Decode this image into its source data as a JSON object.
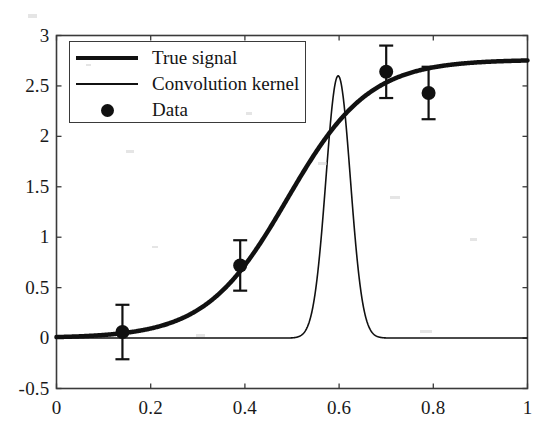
{
  "figure": {
    "background_color": "#ffffff",
    "axis_color": "#3a3a3a",
    "curve_color": "#111111"
  },
  "axes": {
    "x_ticks": [
      "0",
      "0.2",
      "0.4",
      "0.6",
      "0.8",
      "1"
    ],
    "x_tick_values": [
      0,
      0.2,
      0.4,
      0.6,
      0.8,
      1
    ],
    "y_ticks": [
      "-0.5",
      "0",
      "0.5",
      "1",
      "1.5",
      "2",
      "2.5",
      "3"
    ],
    "y_tick_values": [
      -0.5,
      0,
      0.5,
      1,
      1.5,
      2,
      2.5,
      3
    ]
  },
  "legend": {
    "entries": [
      {
        "label": "True signal",
        "marker": "thick-line"
      },
      {
        "label": "Convolution kernel",
        "marker": "thin-line"
      },
      {
        "label": "Data",
        "marker": "filled-circle"
      }
    ]
  },
  "chart_data": {
    "type": "line",
    "title": "",
    "xlabel": "",
    "ylabel": "",
    "xlim": [
      0,
      1
    ],
    "ylim": [
      -0.5,
      3
    ],
    "grid": false,
    "legend_position": "upper-left",
    "series": [
      {
        "name": "True signal",
        "type": "line",
        "style": "thick",
        "linewidth": 4.5,
        "color": "#111111",
        "description": "Sigmoid rising from 0 to about 2.75",
        "model": {
          "form": "logistic",
          "amplitude": 2.76,
          "midpoint": 0.49,
          "slope": 11.5
        },
        "x": [
          0.0,
          0.05,
          0.1,
          0.15,
          0.2,
          0.25,
          0.3,
          0.35,
          0.4,
          0.45,
          0.5,
          0.55,
          0.6,
          0.65,
          0.7,
          0.75,
          0.8,
          0.85,
          0.9,
          0.95,
          1.0
        ],
        "y": [
          0.01,
          0.02,
          0.03,
          0.05,
          0.09,
          0.15,
          0.25,
          0.41,
          0.65,
          0.99,
          1.4,
          1.81,
          2.15,
          2.4,
          2.55,
          2.64,
          2.69,
          2.72,
          2.74,
          2.75,
          2.76
        ]
      },
      {
        "name": "Convolution kernel",
        "type": "line",
        "style": "thin",
        "linewidth": 1.6,
        "color": "#111111",
        "description": "Narrow peak centred near x = 0.60 rising to about 2.60, flat at 0 elsewhere",
        "model": {
          "form": "gaussian",
          "amplitude": 2.6,
          "center": 0.598,
          "sigma": 0.026
        },
        "x": [
          0.0,
          0.1,
          0.2,
          0.3,
          0.4,
          0.45,
          0.5,
          0.52,
          0.54,
          0.56,
          0.58,
          0.59,
          0.6,
          0.61,
          0.62,
          0.64,
          0.66,
          0.68,
          0.7,
          0.8,
          0.9,
          1.0
        ],
        "y": [
          0.0,
          0.0,
          0.0,
          0.0,
          0.01,
          0.02,
          0.07,
          0.17,
          0.45,
          1.05,
          2.05,
          2.48,
          2.6,
          2.45,
          2.0,
          0.95,
          0.28,
          0.06,
          0.02,
          0.0,
          0.0,
          0.0
        ]
      },
      {
        "name": "Data",
        "type": "scatter-errorbar",
        "marker": "filled-circle",
        "marker_size": 14,
        "color": "#111111",
        "x": [
          0.14,
          0.39,
          0.7,
          0.79
        ],
        "y": [
          0.06,
          0.72,
          2.64,
          2.43
        ],
        "yerr": [
          0.27,
          0.25,
          0.26,
          0.26
        ]
      }
    ]
  }
}
